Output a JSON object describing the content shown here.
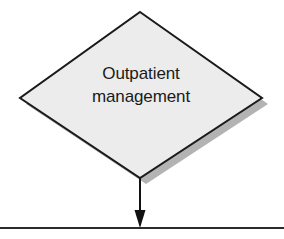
{
  "diagram": {
    "type": "flowchart-fragment",
    "background_color": "#ffffff",
    "nodes": [
      {
        "id": "outpatient-management",
        "shape": "diamond",
        "role": "decision",
        "label": "Outpatient\nmanagement",
        "label_line_1": "Outpatient",
        "label_line_2": "management",
        "fill_color": "#ececec",
        "stroke_color": "#1a1a1a",
        "stroke_width": 2,
        "text_color": "#1a1a1a",
        "shadow_color": "#b3b3b3",
        "shadow_offset_x": 6,
        "shadow_offset_y": 6,
        "center_x": 140,
        "center_y": 95,
        "vertex_top": [
          140,
          12
        ],
        "vertex_right": [
          262,
          98
        ],
        "vertex_bottom": [
          140,
          178
        ],
        "vertex_left": [
          20,
          98
        ]
      }
    ],
    "connectors": [
      {
        "id": "outpatient-to-boundary",
        "kind": "arrow",
        "direction": "down",
        "color": "#111111",
        "line_width": 2,
        "from_x": 140,
        "from_y": 178,
        "to_x": 140,
        "to_y": 227,
        "arrowhead": "solid-triangle",
        "arrowhead_width": 11,
        "arrowhead_height": 17,
        "label": ""
      }
    ],
    "rules": [
      {
        "id": "bottom-divider",
        "kind": "horizontal-line",
        "color": "#2b2b2b",
        "line_width": 2,
        "x1": 0,
        "x2": 284,
        "y": 228
      }
    ]
  }
}
